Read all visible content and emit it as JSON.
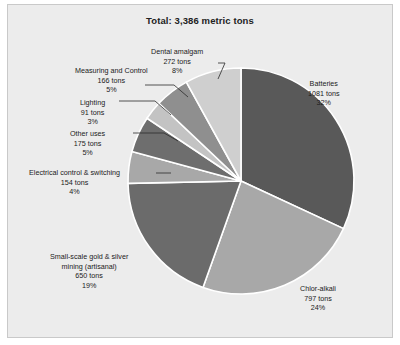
{
  "chart_data": {
    "type": "pie",
    "title": "Total: 3,386 metric tons",
    "total_tons": 3386,
    "units": "metric tons",
    "legend_position": "none",
    "labels_position": "outside-with-leader-lines",
    "start_angle_deg": 0,
    "direction": "clockwise",
    "categories": [
      "Batteries",
      "Chlor-alkali",
      "Small-scale gold & silver mining (artisanal)",
      "Electrical control & switching",
      "Other uses",
      "Lighting",
      "Measuring and Control",
      "Dental amalgam"
    ],
    "values": [
      1081,
      797,
      650,
      154,
      175,
      91,
      166,
      272
    ],
    "percentages": [
      32,
      24,
      19,
      4,
      5,
      3,
      5,
      8
    ],
    "colors": [
      "#595959",
      "#a8a8a8",
      "#6b6b6b",
      "#a8a8a8",
      "#6e6e6e",
      "#c3c3c3",
      "#8f8f8f",
      "#cfcfcf"
    ],
    "slices": [
      {
        "name": "Batteries",
        "name_line2": "",
        "tons_text": "1081 tons",
        "pct_text": "32%",
        "value": 1081,
        "percent": 32,
        "color": "#595959"
      },
      {
        "name": "Chlor-alkali",
        "name_line2": "",
        "tons_text": "797 tons",
        "pct_text": "24%",
        "value": 797,
        "percent": 24,
        "color": "#a8a8a8"
      },
      {
        "name": "Small-scale gold & silver",
        "name_line2": "mining (artisanal)",
        "tons_text": "650 tons",
        "pct_text": "19%",
        "value": 650,
        "percent": 19,
        "color": "#6b6b6b"
      },
      {
        "name": "Electrical control & switching",
        "name_line2": "",
        "tons_text": "154 tons",
        "pct_text": "4%",
        "value": 154,
        "percent": 4,
        "color": "#a8a8a8"
      },
      {
        "name": "Other uses",
        "name_line2": "",
        "tons_text": "175 tons",
        "pct_text": "5%",
        "value": 175,
        "percent": 5,
        "color": "#6e6e6e"
      },
      {
        "name": "Lighting",
        "name_line2": "",
        "tons_text": "91 tons",
        "pct_text": "3%",
        "value": 91,
        "percent": 3,
        "color": "#c3c3c3"
      },
      {
        "name": "Measuring and Control",
        "name_line2": "",
        "tons_text": "166 tons",
        "pct_text": "5%",
        "value": 166,
        "percent": 5,
        "color": "#8f8f8f"
      },
      {
        "name": "Dental amalgam",
        "name_line2": "",
        "tons_text": "272 tons",
        "pct_text": "8%",
        "value": 272,
        "percent": 8,
        "color": "#cfcfcf"
      }
    ]
  },
  "figure": {
    "background": "#ececec",
    "border_color": "#c9c9c9",
    "slice_outline": "#ffffff"
  }
}
